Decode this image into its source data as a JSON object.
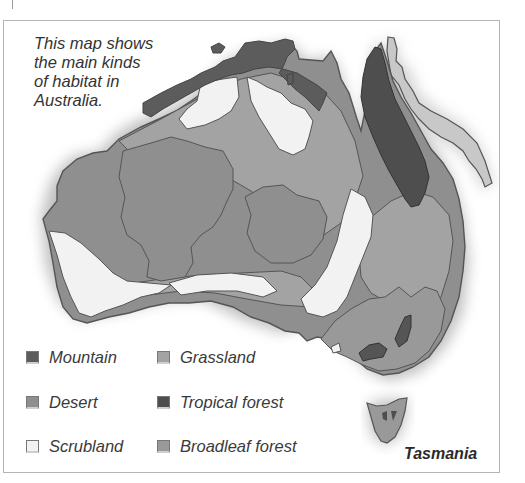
{
  "caption": {
    "lines": [
      "This map shows",
      "the main kinds",
      "of habitat in",
      "Australia."
    ]
  },
  "legend": [
    {
      "label": "Mountain",
      "color": "#5c5c5c",
      "column": 0,
      "row": 0
    },
    {
      "label": "Grassland",
      "color": "#a3a3a3",
      "column": 1,
      "row": 0
    },
    {
      "label": "Desert",
      "color": "#8f8f8f",
      "column": 0,
      "row": 1
    },
    {
      "label": "Tropical forest",
      "color": "#4e4e4e",
      "column": 1,
      "row": 1
    },
    {
      "label": "Scrubland",
      "color": "#f2f2f2",
      "column": 0,
      "row": 2
    },
    {
      "label": "Broadleaf forest",
      "color": "#999999",
      "column": 1,
      "row": 2
    }
  ],
  "map_labels": {
    "tasmania": "Tasmania"
  },
  "colors": {
    "frame": "#b4b4b4",
    "outline": "#555555",
    "desert": "#8f8f8f",
    "grassland": "#a3a3a3",
    "scrubland": "#f2f2f2",
    "mountain": "#5c5c5c",
    "tropical_forest": "#4e4e4e",
    "broadleaf_forest": "#999999",
    "reef": "#c8c8c8"
  }
}
